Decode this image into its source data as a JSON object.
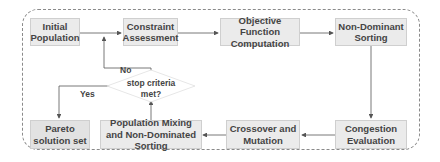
{
  "diagram": {
    "type": "flowchart",
    "nodes": {
      "initial_population": "Initial Population",
      "constraint_assessment": "Constraint Assessment",
      "objective_function": "Objective Function Computation",
      "non_dominant_sorting": "Non-Dominant Sorting",
      "congestion_evaluation": "Congestion Evaluation",
      "crossover_mutation": "Crossover and Mutation",
      "population_mixing": "Population Mixing and Non-Dominated Sorting",
      "pareto_solution": "Pareto solution set",
      "stop_criteria": "stop criteria met?"
    },
    "edge_labels": {
      "no": "No",
      "yes": "Yes"
    },
    "edges": [
      {
        "from": "initial_population",
        "to": "constraint_assessment"
      },
      {
        "from": "constraint_assessment",
        "to": "objective_function"
      },
      {
        "from": "objective_function",
        "to": "non_dominant_sorting"
      },
      {
        "from": "non_dominant_sorting",
        "to": "congestion_evaluation"
      },
      {
        "from": "congestion_evaluation",
        "to": "crossover_mutation"
      },
      {
        "from": "crossover_mutation",
        "to": "population_mixing"
      },
      {
        "from": "population_mixing",
        "to": "stop_criteria"
      },
      {
        "from": "stop_criteria",
        "to": "constraint_assessment",
        "label": "No"
      },
      {
        "from": "stop_criteria",
        "to": "pareto_solution",
        "label": "Yes"
      }
    ],
    "colors": {
      "box_fill": "#ebebeb",
      "box_border": "#cfcfcf",
      "text": "#444444",
      "line": "#555555",
      "frame": "#8a8a8a"
    }
  }
}
